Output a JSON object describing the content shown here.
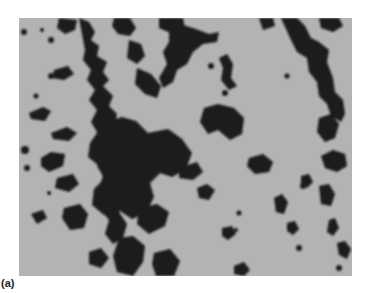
{
  "figure": {
    "panel_label": "(a)",
    "image_description": "Grayscale micrograph showing dark clustered particles/cells forming branching chain-like aggregates on a light gray background",
    "colors": {
      "background": "#b3b3b3",
      "particles": "#1a1a1a",
      "page": "#ffffff"
    }
  }
}
